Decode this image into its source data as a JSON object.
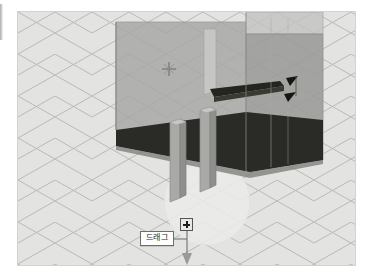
{
  "app": {
    "kind": "3d-modeling-viewport",
    "background_color": "#e2e3e1",
    "grid_color": "#b9bbb7"
  },
  "viewport": {
    "label": "3D modeling viewport",
    "grid": {
      "type": "isometric",
      "visible": true,
      "spacing_px": 37,
      "color": "#b7b9b5"
    },
    "model": {
      "name": "table-model",
      "description": "semi-transparent gray box with dark underside and two legs",
      "face_color": "#9e9f9c",
      "face_color_light": "#b3b4b1",
      "face_color_dark": "#8a8b88",
      "underside_color": "#2a2a2a",
      "edge_color": "#7d7e7b",
      "legs": 2
    },
    "markers": {
      "crosshair": {
        "name": "inference-point-crosshair",
        "x": 169,
        "y": 69,
        "color": "#6b6c69"
      },
      "guide_circle": {
        "name": "protractor-guide-circle",
        "cx": 189,
        "cy": 190,
        "r": 43,
        "color": "#efefed"
      },
      "arrow_marks": [
        {
          "name": "dimension-arrow-upper",
          "x": 287,
          "y": 71
        },
        {
          "name": "dimension-arrow-lower",
          "x": 287,
          "y": 84
        }
      ]
    }
  },
  "drag_handle": {
    "name": "push-pull-handle",
    "icon": "plus-icon",
    "x": 180,
    "y": 218,
    "size": 13
  },
  "drag_line": {
    "name": "drag-direction-line",
    "from_x": 187,
    "from_y": 231,
    "to_x": 187,
    "to_y": 262,
    "color": "#7a7a7a",
    "arrow": "down-arrow"
  },
  "connector": {
    "name": "callout-connector",
    "from_x": 178,
    "from_y": 239,
    "to_x": 187,
    "to_y": 239,
    "color": "#6d6d6d"
  },
  "callout": {
    "name": "drag-callout",
    "text": "드래그",
    "border_color": "#6d6d6d",
    "background": "#fdfdfd",
    "text_color": "#2b2b2b"
  }
}
